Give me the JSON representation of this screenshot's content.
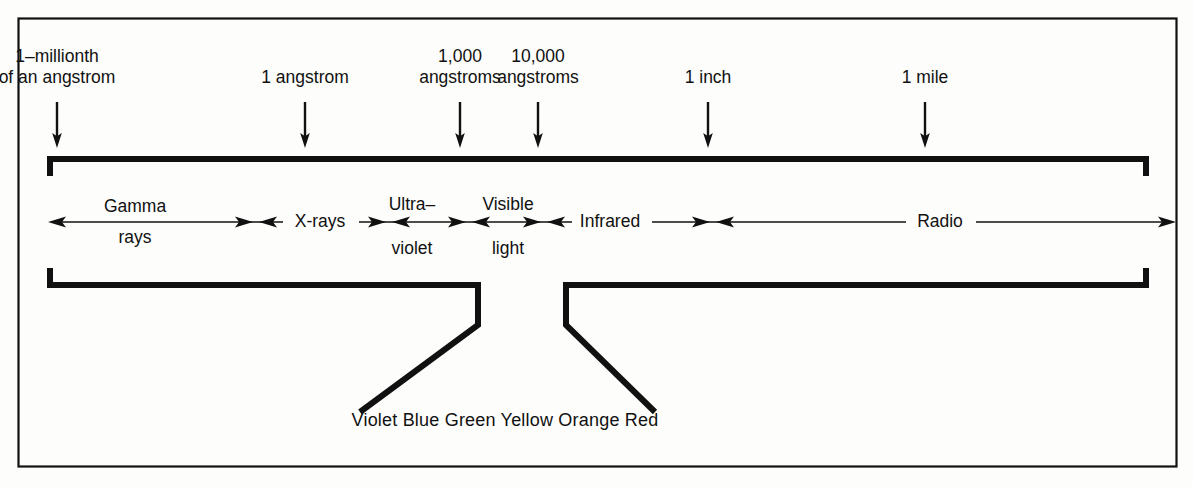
{
  "figure": {
    "type": "electromagnetic-spectrum-diagram",
    "background_color": "#fdfdfb",
    "ink_color": "#111111"
  },
  "scale_markers": [
    {
      "id": "millionth-angstrom",
      "line1": "1–millionth",
      "line2": "of an angstrom",
      "x": 57
    },
    {
      "id": "one-angstrom",
      "line1": "1 angstrom",
      "line2": "",
      "x": 305
    },
    {
      "id": "thousand-angstroms",
      "line1": "1,000",
      "line2": "angstroms",
      "x": 460
    },
    {
      "id": "ten-thousand-angstroms",
      "line1": "10,000",
      "line2": "angstroms",
      "x": 538
    },
    {
      "id": "one-inch",
      "line1": "1 inch",
      "line2": "",
      "x": 708
    },
    {
      "id": "one-mile",
      "line1": "1 mile",
      "line2": "",
      "x": 925
    }
  ],
  "bands": [
    {
      "id": "gamma-rays",
      "line1": "Gamma",
      "line2": "rays",
      "x": 135,
      "layout": "split"
    },
    {
      "id": "x-rays",
      "line1": "X-rays",
      "line2": "",
      "x": 320,
      "layout": "inline"
    },
    {
      "id": "ultraviolet",
      "line1": "Ultra–",
      "line2": "violet",
      "x": 412,
      "layout": "split"
    },
    {
      "id": "visible-light",
      "line1": "Visible",
      "line2": "light",
      "x": 508,
      "layout": "split"
    },
    {
      "id": "infrared",
      "line1": "Infrared",
      "line2": "",
      "x": 610,
      "layout": "inline"
    },
    {
      "id": "radio",
      "line1": "Radio",
      "line2": "",
      "x": 940,
      "layout": "inline"
    }
  ],
  "visible_colors": {
    "text": "Violet Blue Green Yellow Orange Red",
    "x": 505,
    "y": 420
  }
}
